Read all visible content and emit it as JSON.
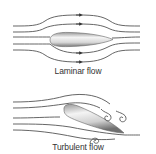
{
  "diagram": {
    "panels": [
      {
        "id": "laminar",
        "caption": "Laminar flow",
        "streamlines": 6,
        "arrows": 4,
        "body": "streamlined airfoil, horizontal"
      },
      {
        "id": "turbulent",
        "caption": "Turbulent flow",
        "streamlines": 5,
        "vortices": 3,
        "body": "airfoil at angle of attack"
      }
    ],
    "colors": {
      "line": "#555555",
      "body_light": "#f2f2f2",
      "body_dark": "#8a8a8a",
      "text": "#333333"
    }
  }
}
